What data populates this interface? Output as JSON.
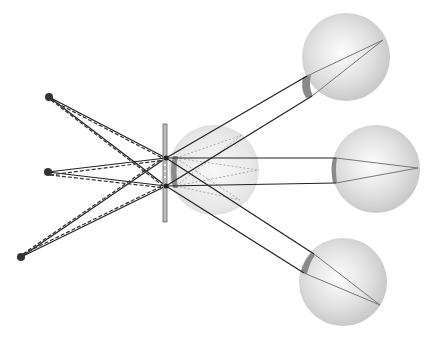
{
  "diagram": {
    "colors": {
      "background": "#ffffff",
      "ray": "#222222",
      "dashed_ray": "#333333",
      "eye_fill_center": "#fbfbfb",
      "eye_fill_edge": "#c8c8c8",
      "lens": "#8a8a8a",
      "screen": "#9a9a9a",
      "inner_ray": "#777777",
      "point": "#333333"
    },
    "sources": [
      {
        "id": "top",
        "x": 49,
        "y": 97
      },
      {
        "id": "middle",
        "x": 48,
        "y": 172
      },
      {
        "id": "bottom",
        "x": 21,
        "y": 257
      }
    ],
    "screen": {
      "x": 165,
      "y1": 124,
      "y2": 222,
      "width": 4
    },
    "pinholes": [
      {
        "id": "upper",
        "x": 166,
        "y": 158
      },
      {
        "id": "lower",
        "x": 166,
        "y": 186
      }
    ],
    "center_eye": {
      "cx": 214,
      "cy": 170,
      "r": 45
    },
    "eyes": [
      {
        "id": "top-eye",
        "cx": 346,
        "cy": 57,
        "r": 44
      },
      {
        "id": "middle-eye",
        "cx": 376,
        "cy": 169,
        "r": 44
      },
      {
        "id": "bottom-eye",
        "cx": 343,
        "cy": 282,
        "r": 44
      }
    ]
  }
}
